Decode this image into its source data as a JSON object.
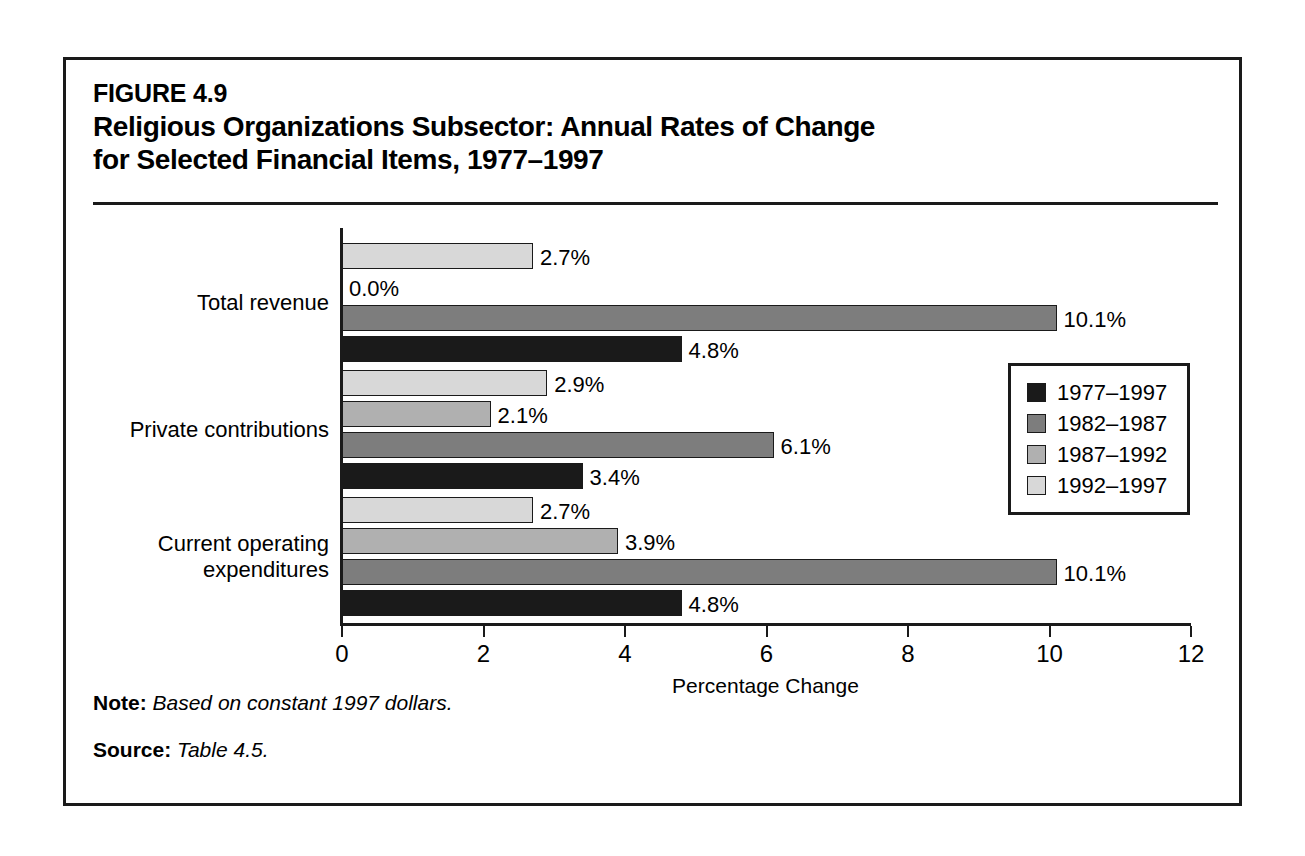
{
  "figure": {
    "number": "FIGURE 4.9",
    "title_line1": "Religious Organizations Subsector: Annual Rates of Change",
    "title_line2": "for Selected Financial Items, 1977–1997"
  },
  "footnotes": {
    "note_label": "Note:",
    "note_text": " Based on constant 1997 dollars.",
    "source_label": "Source:",
    "source_text": " Table 4.5."
  },
  "legend": {
    "items": [
      {
        "label": "1977–1997",
        "color": "#1a1a1a"
      },
      {
        "label": "1982–1987",
        "color": "#7d7d7d"
      },
      {
        "label": "1987–1992",
        "color": "#b0b0b0"
      },
      {
        "label": "1992–1997",
        "color": "#d8d8d8"
      }
    ]
  },
  "chart_data": {
    "type": "bar",
    "orientation": "horizontal",
    "title": "Religious Organizations Subsector: Annual Rates of Change for Selected Financial Items, 1977–1997",
    "xlabel": "Percentage Change",
    "ylabel": "",
    "xlim": [
      0,
      12
    ],
    "xticks": [
      0,
      2,
      4,
      6,
      8,
      10,
      12
    ],
    "xtick_labels": [
      "0",
      "2",
      "4",
      "6",
      "8",
      "10",
      "12"
    ],
    "grid": false,
    "legend_position": "right-middle",
    "categories": [
      "Total revenue",
      "Private contributions",
      "Current operating expenditures"
    ],
    "category_label_lines": [
      [
        "Total revenue"
      ],
      [
        "Private contributions"
      ],
      [
        "Current operating",
        "expenditures"
      ]
    ],
    "series": [
      {
        "name": "1977–1997",
        "color": "#1a1a1a",
        "values": [
          4.8,
          3.4,
          4.8
        ],
        "labels": [
          "4.8%",
          "3.4%",
          "4.8%"
        ]
      },
      {
        "name": "1982–1987",
        "color": "#7d7d7d",
        "values": [
          10.1,
          6.1,
          10.1
        ],
        "labels": [
          "10.1%",
          "6.1%",
          "10.1%"
        ]
      },
      {
        "name": "1987–1992",
        "color": "#b0b0b0",
        "values": [
          0.0,
          2.1,
          3.9
        ],
        "labels": [
          "0.0%",
          "2.1%",
          "3.9%"
        ]
      },
      {
        "name": "1992–1997",
        "color": "#d8d8d8",
        "values": [
          2.7,
          2.9,
          2.7
        ],
        "labels": [
          "2.7%",
          "2.9%",
          "2.7%"
        ]
      }
    ]
  }
}
